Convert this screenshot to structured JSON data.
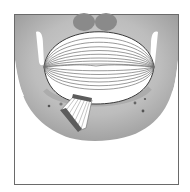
{
  "figure": {
    "colors": {
      "background": "#ffffff",
      "frame": "#6a6a6a",
      "bone_light": "#c9c9c9",
      "bone_mid": "#a9a9a9",
      "bone_dark": "#7c7c7c",
      "muscle_fill": "#ffffff",
      "muscle_lines": "#6f6f6f",
      "fan_band": "#5c5c5c"
    },
    "elements": {
      "frame": "image-frame",
      "bone": "mandible-silhouette",
      "muscle": "elliptical-muscle-fibers",
      "fan": "fan-shaped-muscle",
      "foramina": "small-foramina-dots"
    }
  }
}
